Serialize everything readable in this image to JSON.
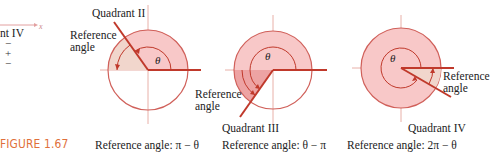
{
  "figure": {
    "label": "FIGURE 1.67",
    "accent_color": "#e0703a",
    "circle_fill": "#f8c8c8",
    "ref_fill": "#eda3a3",
    "line_color": "#c0392b"
  },
  "left_fragment": {
    "axis_label": "x",
    "quadrant_text": "nt IV",
    "signs": [
      "−",
      "+",
      "−"
    ]
  },
  "panels": [
    {
      "quadrant_label": "Quadrant II",
      "ref_label_line1": "Reference",
      "ref_label_line2": "angle",
      "theta": "θ",
      "caption": "Reference angle: π − θ"
    },
    {
      "quadrant_label": "Quadrant III",
      "ref_label_line1": "Reference",
      "ref_label_line2": "angle",
      "theta": "θ",
      "caption": "Reference angle: θ − π"
    },
    {
      "quadrant_label": "Quadrant IV",
      "ref_label_line1": "Reference",
      "ref_label_line2": "angle",
      "theta": "θ",
      "caption": "Reference angle: 2π − θ"
    }
  ]
}
